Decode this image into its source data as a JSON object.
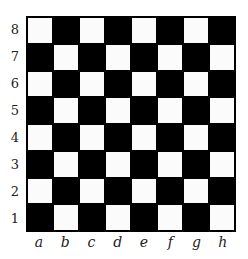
{
  "board": {
    "size": 8,
    "colors": {
      "light": "#fbfbfb",
      "dark": "#000000",
      "border": "#000000"
    },
    "top_left_square": "light"
  },
  "ranks": [
    "8",
    "7",
    "6",
    "5",
    "4",
    "3",
    "2",
    "1"
  ],
  "files": [
    "a",
    "b",
    "c",
    "d",
    "e",
    "f",
    "g",
    "h"
  ]
}
